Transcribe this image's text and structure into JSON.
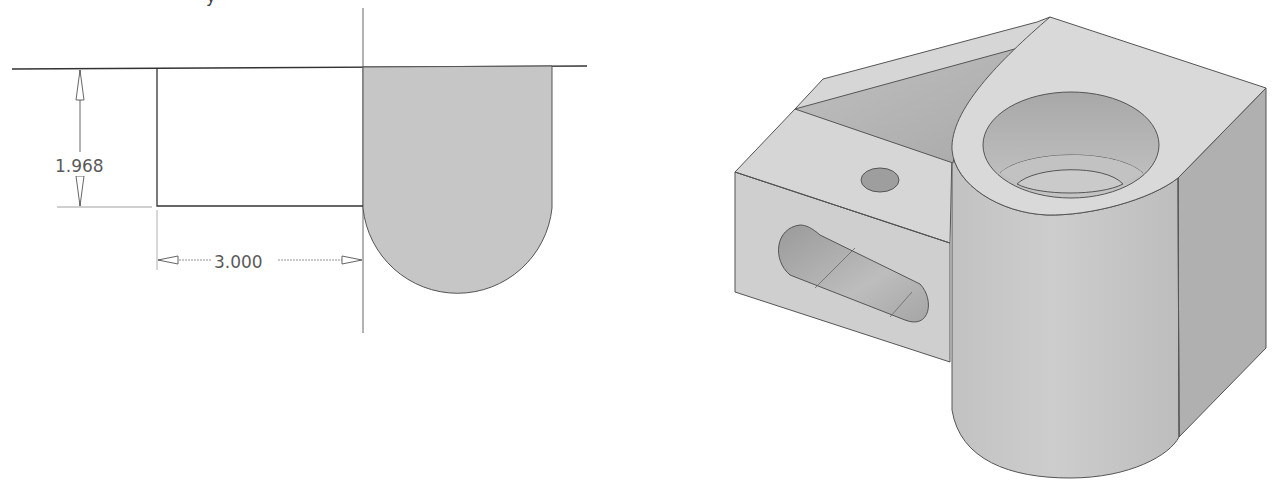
{
  "figure": {
    "top_cut_glyph": "y",
    "sketch_2d": {
      "dimension_vertical": {
        "label": "1.968"
      },
      "dimension_horizontal": {
        "label": "3.000"
      },
      "profile_fill": "#c6c6c6",
      "line_color": "#333333"
    },
    "model_3d": {
      "description": "Isometric shaded view of machined bracket with counterbored cylindrical boss, slot, small hole and triangular groove",
      "colors": {
        "top": "#d8d8d8",
        "left_face": "#cfcfcf",
        "cylinder": "#c8c8c8",
        "right_face": "#b0b0b0",
        "groove": "#b8b8b8",
        "hole_dark": "#9e9e9e",
        "edge": "#555555"
      }
    }
  }
}
